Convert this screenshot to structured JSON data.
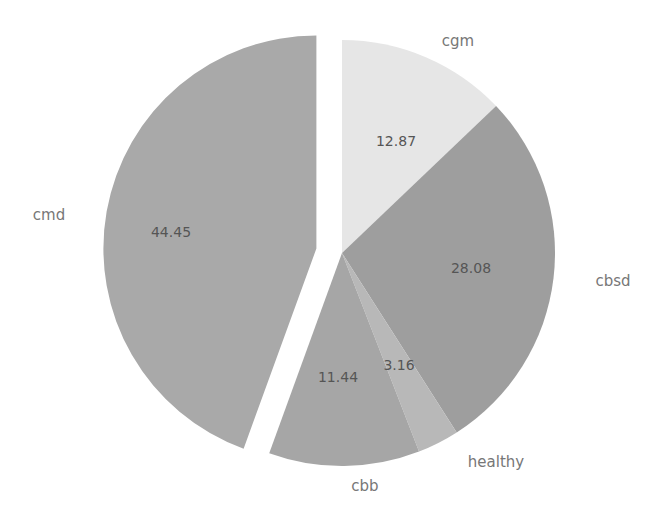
{
  "chart_data": {
    "type": "pie",
    "title": "",
    "categories": [
      "cgm",
      "cbsd",
      "healthy",
      "cbb",
      "cmd"
    ],
    "values": [
      12.87,
      28.08,
      3.16,
      11.44,
      44.45
    ],
    "value_labels": [
      "12.87",
      "28.08",
      "3.16",
      "11.44",
      "44.45"
    ],
    "colors": [
      "#e6e6e6",
      "#9e9e9e",
      "#b8b8b8",
      "#a6a6a6",
      "#a9a9a9"
    ],
    "exploded": "cmd",
    "start_angle_deg": 0,
    "direction": "clockwise",
    "legend": "none"
  },
  "labels": {
    "cgm": "cgm",
    "cbsd": "cbsd",
    "healthy": "healthy",
    "cbb": "cbb",
    "cmd": "cmd"
  },
  "values": {
    "cgm": "12.87",
    "cbsd": "28.08",
    "healthy": "3.16",
    "cbb": "11.44",
    "cmd": "44.45"
  }
}
